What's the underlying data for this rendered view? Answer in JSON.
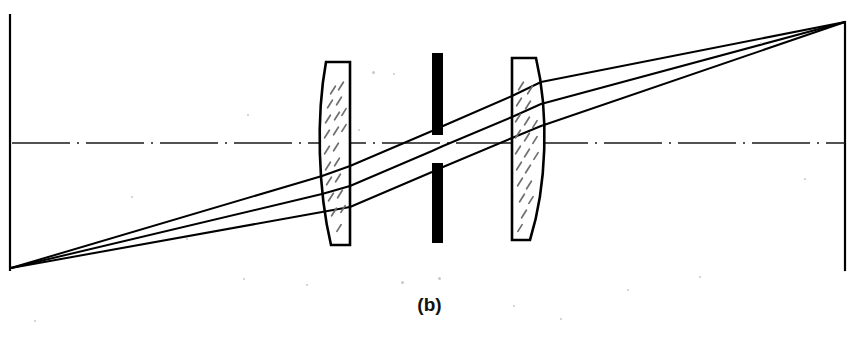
{
  "figure": {
    "caption": "(b)",
    "background_color": "#ffffff",
    "ink_color": "#000000",
    "hatch_color": "#6f6f6f",
    "axis_color": "#1a1a1a",
    "width": 859,
    "height": 346
  },
  "frame": {
    "name": "figure-border",
    "left_rule": {
      "x": 10,
      "y1": 15,
      "y2": 270
    },
    "right_rule": {
      "x": 845,
      "y1": 22,
      "y2": 270
    },
    "stroke_width": 2.2
  },
  "optical_axis": {
    "label": "optical axis",
    "y": 143,
    "x1": 12,
    "x2": 845,
    "style": "dash-dot",
    "dash_pattern": "58 7 2 7",
    "stroke_width": 1.6
  },
  "components": [
    {
      "id": "lens-1",
      "label": "Front plano-convex lens",
      "type": "plano-convex",
      "orientation": "convex-left",
      "x_front": 322,
      "x_flat": 350,
      "y_top": 62,
      "y_bottom": 245,
      "bulge": 20,
      "hatched": true
    },
    {
      "id": "aperture-stop",
      "label": "Aperture stop",
      "type": "stop",
      "x_left": 432,
      "x_right": 443,
      "upper_blade": {
        "y_top": 53,
        "y_bottom": 135
      },
      "lower_blade": {
        "y_top": 163,
        "y_bottom": 243
      },
      "opening_height": 28,
      "fill": "#000000"
    },
    {
      "id": "lens-2",
      "label": "Rear plano-convex lens",
      "type": "plano-convex",
      "orientation": "convex-right",
      "x_flat": 512,
      "x_back": 541,
      "y_top": 58,
      "y_bottom": 240,
      "bulge": 20,
      "hatched": true
    }
  ],
  "rays": {
    "count": 3,
    "object_point": {
      "x": 11,
      "y": 268
    },
    "image_point": {
      "x": 845,
      "y": 22
    },
    "stroke_width": 2.0,
    "paths": [
      {
        "id": "ray-upper",
        "points": [
          {
            "x": 11,
            "y": 268
          },
          {
            "x": 322,
            "y": 176
          },
          {
            "x": 350,
            "y": 166
          },
          {
            "x": 432,
            "y": 131
          },
          {
            "x": 443,
            "y": 126
          },
          {
            "x": 512,
            "y": 96
          },
          {
            "x": 541,
            "y": 82
          },
          {
            "x": 845,
            "y": 22
          }
        ]
      },
      {
        "id": "ray-middle",
        "points": [
          {
            "x": 11,
            "y": 268
          },
          {
            "x": 322,
            "y": 194
          },
          {
            "x": 350,
            "y": 186
          },
          {
            "x": 432,
            "y": 151
          },
          {
            "x": 443,
            "y": 146
          },
          {
            "x": 512,
            "y": 117
          },
          {
            "x": 541,
            "y": 104
          },
          {
            "x": 845,
            "y": 22
          }
        ]
      },
      {
        "id": "ray-lower",
        "points": [
          {
            "x": 11,
            "y": 268
          },
          {
            "x": 322,
            "y": 212
          },
          {
            "x": 350,
            "y": 207
          },
          {
            "x": 432,
            "y": 172
          },
          {
            "x": 443,
            "y": 167
          },
          {
            "x": 512,
            "y": 138
          },
          {
            "x": 541,
            "y": 126
          },
          {
            "x": 845,
            "y": 22
          }
        ]
      }
    ]
  },
  "hatching": {
    "lens1_marks": [
      {
        "x": 333,
        "y": 90,
        "len": 9,
        "a": -58
      },
      {
        "x": 341,
        "y": 86,
        "len": 9,
        "a": -58
      },
      {
        "x": 330,
        "y": 104,
        "len": 9,
        "a": -58
      },
      {
        "x": 339,
        "y": 101,
        "len": 9,
        "a": -58
      },
      {
        "x": 328,
        "y": 119,
        "len": 9,
        "a": -58
      },
      {
        "x": 337,
        "y": 116,
        "len": 9,
        "a": -58
      },
      {
        "x": 344,
        "y": 112,
        "len": 8,
        "a": -58
      },
      {
        "x": 327,
        "y": 134,
        "len": 9,
        "a": -58
      },
      {
        "x": 336,
        "y": 131,
        "len": 9,
        "a": -58
      },
      {
        "x": 344,
        "y": 128,
        "len": 8,
        "a": -58
      },
      {
        "x": 327,
        "y": 150,
        "len": 9,
        "a": -58
      },
      {
        "x": 336,
        "y": 147,
        "len": 9,
        "a": -58
      },
      {
        "x": 328,
        "y": 166,
        "len": 9,
        "a": -58
      },
      {
        "x": 337,
        "y": 162,
        "len": 9,
        "a": -58
      },
      {
        "x": 329,
        "y": 181,
        "len": 9,
        "a": -58
      },
      {
        "x": 338,
        "y": 178,
        "len": 9,
        "a": -58
      },
      {
        "x": 331,
        "y": 197,
        "len": 9,
        "a": -58
      },
      {
        "x": 340,
        "y": 194,
        "len": 9,
        "a": -58
      },
      {
        "x": 334,
        "y": 212,
        "len": 9,
        "a": -58
      },
      {
        "x": 343,
        "y": 209,
        "len": 8,
        "a": -58
      },
      {
        "x": 339,
        "y": 228,
        "len": 8,
        "a": -58
      }
    ],
    "lens2_marks": [
      {
        "x": 521,
        "y": 86,
        "len": 9,
        "a": -58
      },
      {
        "x": 530,
        "y": 90,
        "len": 9,
        "a": -58
      },
      {
        "x": 519,
        "y": 102,
        "len": 9,
        "a": -58
      },
      {
        "x": 528,
        "y": 105,
        "len": 9,
        "a": -58
      },
      {
        "x": 518,
        "y": 118,
        "len": 9,
        "a": -58
      },
      {
        "x": 527,
        "y": 121,
        "len": 9,
        "a": -58
      },
      {
        "x": 535,
        "y": 124,
        "len": 8,
        "a": -58
      },
      {
        "x": 518,
        "y": 134,
        "len": 9,
        "a": -58
      },
      {
        "x": 527,
        "y": 137,
        "len": 9,
        "a": -58
      },
      {
        "x": 535,
        "y": 140,
        "len": 8,
        "a": -58
      },
      {
        "x": 518,
        "y": 150,
        "len": 9,
        "a": -58
      },
      {
        "x": 527,
        "y": 153,
        "len": 9,
        "a": -58
      },
      {
        "x": 536,
        "y": 156,
        "len": 8,
        "a": -58
      },
      {
        "x": 519,
        "y": 166,
        "len": 9,
        "a": -58
      },
      {
        "x": 528,
        "y": 169,
        "len": 9,
        "a": -58
      },
      {
        "x": 520,
        "y": 182,
        "len": 9,
        "a": -58
      },
      {
        "x": 529,
        "y": 185,
        "len": 9,
        "a": -58
      },
      {
        "x": 522,
        "y": 198,
        "len": 9,
        "a": -58
      },
      {
        "x": 531,
        "y": 200,
        "len": 8,
        "a": -58
      },
      {
        "x": 524,
        "y": 214,
        "len": 9,
        "a": -58
      },
      {
        "x": 520,
        "y": 228,
        "len": 8,
        "a": -58
      }
    ]
  },
  "specks": [
    {
      "x": 372,
      "y": 71,
      "d": 3
    },
    {
      "x": 393,
      "y": 73,
      "d": 2
    },
    {
      "x": 247,
      "y": 114,
      "d": 2
    },
    {
      "x": 358,
      "y": 129,
      "d": 2
    },
    {
      "x": 131,
      "y": 196,
      "d": 2
    },
    {
      "x": 186,
      "y": 238,
      "d": 2
    },
    {
      "x": 243,
      "y": 278,
      "d": 2
    },
    {
      "x": 306,
      "y": 284,
      "d": 2
    },
    {
      "x": 401,
      "y": 281,
      "d": 3
    },
    {
      "x": 438,
      "y": 277,
      "d": 3
    },
    {
      "x": 513,
      "y": 305,
      "d": 2
    },
    {
      "x": 560,
      "y": 318,
      "d": 2
    },
    {
      "x": 627,
      "y": 289,
      "d": 2
    },
    {
      "x": 699,
      "y": 276,
      "d": 2
    },
    {
      "x": 34,
      "y": 320,
      "d": 2
    },
    {
      "x": 760,
      "y": 42,
      "d": 2
    },
    {
      "x": 804,
      "y": 178,
      "d": 2
    }
  ]
}
